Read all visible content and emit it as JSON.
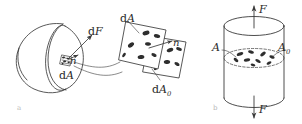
{
  "figure": {
    "background": "#ffffff",
    "ink_color": "#3a3a3a",
    "fiber_color": "#2e2e2e",
    "panel_label_color": "#b9b9b9",
    "width": 302,
    "height": 124
  },
  "panels": [
    {
      "id": "a",
      "label": "a",
      "name": "cut-body-panel",
      "description": "Sectioned solid body with a cut plane, enlarged detail of the area element"
    },
    {
      "id": "b",
      "label": "b",
      "name": "loaded-cylinder-panel",
      "description": "Cylindrical bar loaded in tension showing gross area A and effective area A0"
    }
  ],
  "labels": {
    "dF": {
      "text": "dF",
      "upright": "d",
      "italic": "F"
    },
    "n_body": {
      "text": "n"
    },
    "dA_body": {
      "text": "dA",
      "upright": "d",
      "italic": "A"
    },
    "dA_detail": {
      "text": "dA",
      "upright": "d",
      "italic": "A"
    },
    "n_detail": {
      "text": "n"
    },
    "dA0_detail": {
      "text": "dA",
      "upright": "d",
      "italic": "A",
      "subscript": "0"
    },
    "force_top": {
      "text": "F"
    },
    "force_bottom": {
      "text": "F"
    },
    "area_A": {
      "text": "A"
    },
    "area_A0": {
      "text": "A",
      "subscript": "0"
    }
  },
  "icons": {
    "arrow_force_up": "arrow-up-icon",
    "arrow_force_down": "arrow-down-icon",
    "arrow_normal": "normal-vector-arrow-icon",
    "arrow_dF": "force-vector-arrow-icon",
    "leader_line": "leader-line-icon"
  }
}
